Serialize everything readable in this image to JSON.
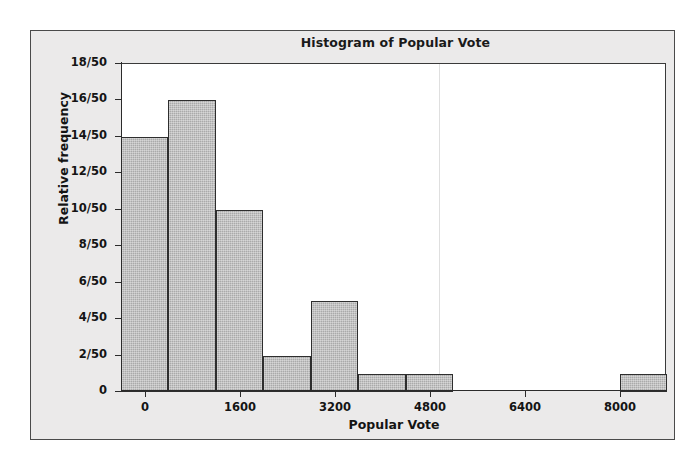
{
  "chart_data": {
    "type": "bar",
    "title": "Histogram of Popular Vote",
    "xlabel": "Popular Vote",
    "ylabel": "Relative frequency",
    "grid": false,
    "legend": null,
    "bin_width": 800,
    "sample_size": 50,
    "xlim": [
      -400,
      8800
    ],
    "ylim": [
      0,
      0.36
    ],
    "x_tick_labels": [
      "0",
      "1600",
      "3200",
      "4800",
      "6400",
      "8000"
    ],
    "x_tick_values": [
      0,
      1600,
      3200,
      4800,
      6400,
      8000
    ],
    "y_tick_labels": [
      "0",
      "2/50",
      "4/50",
      "6/50",
      "8/50",
      "10/50",
      "12/50",
      "14/50",
      "16/50",
      "18/50"
    ],
    "y_tick_values": [
      0,
      2,
      4,
      6,
      8,
      10,
      12,
      14,
      16,
      18
    ],
    "bins": [
      {
        "label": "-400 to 400",
        "x_start": -400,
        "x_end": 400,
        "count": 14,
        "value": "14/50"
      },
      {
        "label": "400 to 1200",
        "x_start": 400,
        "x_end": 1200,
        "count": 16,
        "value": "16/50"
      },
      {
        "label": "1200 to 2000",
        "x_start": 1200,
        "x_end": 2000,
        "count": 10,
        "value": "10/50"
      },
      {
        "label": "2000 to 2800",
        "x_start": 2000,
        "x_end": 2800,
        "count": 2,
        "value": "2/50"
      },
      {
        "label": "2800 to 3600",
        "x_start": 2800,
        "x_end": 3600,
        "count": 5,
        "value": "5/50"
      },
      {
        "label": "3600 to 4400",
        "x_start": 3600,
        "x_end": 4400,
        "count": 1,
        "value": "1/50"
      },
      {
        "label": "4400 to 5200",
        "x_start": 4400,
        "x_end": 5200,
        "count": 1,
        "value": "1/50"
      },
      {
        "label": "8000 to 8800",
        "x_start": 8000,
        "x_end": 8800,
        "count": 1,
        "value": "1/50"
      }
    ],
    "categories": [
      "-400 to 400",
      "400 to 1200",
      "1200 to 2000",
      "2000 to 2800",
      "2800 to 3600",
      "3600 to 4400",
      "4400 to 5200",
      "8000 to 8800"
    ],
    "values": [
      14,
      16,
      10,
      2,
      5,
      1,
      1,
      1
    ]
  },
  "colors": {
    "bar_fill": "#aaaaaa",
    "bar_border": "#2e2e2e",
    "panel_background": "#ebeaea",
    "plot_background": "#ffffff",
    "axis": "#2b2b2b",
    "text": "#141414"
  }
}
